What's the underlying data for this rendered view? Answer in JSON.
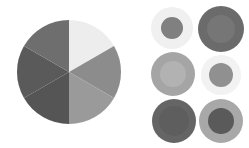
{
  "figure": {
    "background_color": "#ffffff"
  },
  "chart_data": [
    {
      "type": "pie",
      "name": "six-wedge-grayscale-pie",
      "title": "",
      "xlabel": "",
      "ylabel": "",
      "start_angle_deg": 90,
      "direction": "clockwise",
      "center_x": 53,
      "center_y": 55,
      "radius": 52,
      "legend": "none",
      "grid": false,
      "categories": [
        "wedge-1-top-right",
        "wedge-2-right",
        "wedge-3-bottom-right",
        "wedge-4-bottom-left",
        "wedge-5-left",
        "wedge-6-top-left"
      ],
      "values": [
        16.6667,
        16.6667,
        16.6667,
        16.6667,
        16.6667,
        16.6667
      ],
      "angles_deg": [
        60,
        60,
        60,
        60,
        60,
        60
      ],
      "colors": [
        "#ededed",
        "#8c8c8c",
        "#9a9a9a",
        "#555555",
        "#5a5a5a",
        "#6e6e6e"
      ]
    },
    {
      "type": "scatter",
      "name": "concentric-circle-swatch-grid",
      "title": "",
      "xlabel": "",
      "ylabel": "",
      "legend": "none",
      "grid": false,
      "rows": 3,
      "columns": 2,
      "points": [
        {
          "id": "swatch-1",
          "row": 1,
          "column": 1,
          "cx": 22,
          "cy": 22,
          "outer_radius": 21,
          "inner_radius": 11,
          "outer_color": "#f0f0f0",
          "inner_color": "#808080"
        },
        {
          "id": "swatch-2",
          "row": 1,
          "column": 2,
          "cx": 71,
          "cy": 23,
          "outer_radius": 23,
          "inner_radius": 14,
          "outer_color": "#6b6b6b",
          "inner_color": "#767676"
        },
        {
          "id": "swatch-3",
          "row": 2,
          "column": 1,
          "cx": 23,
          "cy": 68,
          "outer_radius": 22,
          "inner_radius": 13,
          "outer_color": "#a5a5a5",
          "inner_color": "#b2b2b2"
        },
        {
          "id": "swatch-4",
          "row": 2,
          "column": 2,
          "cx": 71,
          "cy": 69,
          "outer_radius": 20,
          "inner_radius": 12,
          "outer_color": "#f2f2f2",
          "inner_color": "#909090"
        },
        {
          "id": "swatch-5",
          "row": 3,
          "column": 1,
          "cx": 24,
          "cy": 115,
          "outer_radius": 22,
          "inner_radius": 15,
          "outer_color": "#656565",
          "inner_color": "#5e5e5e"
        },
        {
          "id": "swatch-6",
          "row": 3,
          "column": 2,
          "cx": 71,
          "cy": 115,
          "outer_radius": 22,
          "inner_radius": 13,
          "outer_color": "#a8a8a8",
          "inner_color": "#5a5a5a"
        }
      ]
    }
  ]
}
